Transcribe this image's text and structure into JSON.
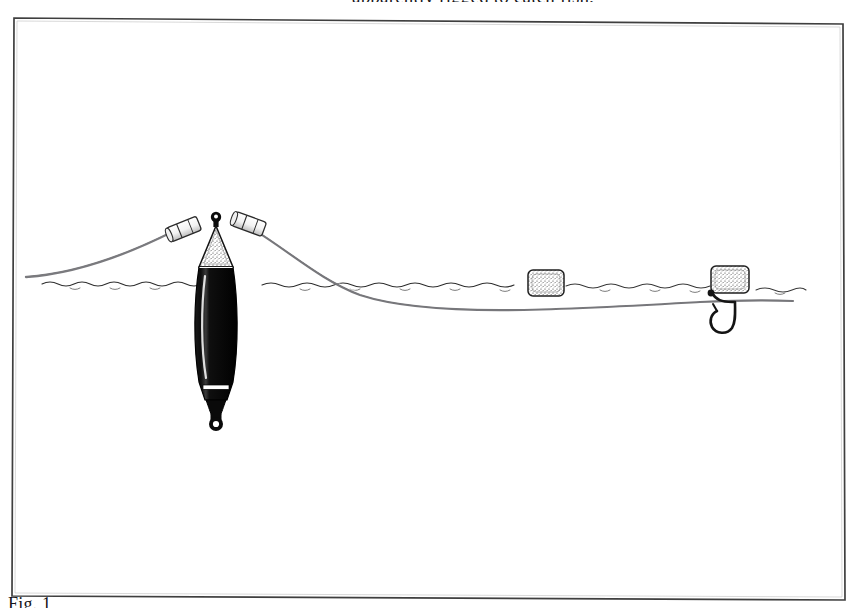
{
  "page": {
    "media": "scanned-book-page",
    "background_color": "#ffffff",
    "ink_color": "#17161a"
  },
  "body_text": {
    "partial_line_above_figure": "apparently rigged to catch fish,",
    "note": "line is cropped by the top edge of the screenshot"
  },
  "caption": {
    "text": "Fig. 1",
    "note": "caption is cropped by the bottom edge of the screenshot"
  },
  "figure": {
    "title": "Fishing float rig with baited hook",
    "frame": {
      "stroke_color": "#3a3a3a",
      "stroke_width": 1.6,
      "fill": "#ffffff",
      "corners": {
        "top_left": [
          14,
          18
        ],
        "top_right": [
          843,
          24
        ],
        "bottom_right": [
          845,
          600
        ],
        "bottom_left": [
          12,
          596
        ]
      },
      "skew_note": "frame is slightly rotated from the scan"
    },
    "waterline": {
      "label": "water surface",
      "y": 284,
      "x_start": 42,
      "x_end": 800,
      "style": "hand-drawn wavy ripple line",
      "color": "#2b2b2b"
    },
    "fishing_line": {
      "label": "monofilament line",
      "color": "#6f6f72",
      "segments": [
        {
          "name": "rod-side-line",
          "from": [
            26,
            276
          ],
          "to": [
            178,
            228
          ]
        },
        {
          "name": "float-to-hook-line",
          "from": [
            246,
            224
          ],
          "to": [
            793,
            301
          ]
        }
      ]
    },
    "float": {
      "label": "slider float / bobber",
      "body_color": "#111111",
      "tip_color": "#ffffff",
      "tip_style": "stippled conical antenna tip",
      "center_x": 216,
      "top_y": 214,
      "bottom_y": 430,
      "body_width": 40,
      "parts": [
        "top wire ring",
        "stippled white cone tip",
        "black barrel body",
        "white band near base",
        "tapered stem",
        "bottom eyelet ring"
      ]
    },
    "stop_beads": [
      {
        "name": "left-stop-bead",
        "x": 184,
        "y": 229,
        "angle": -22
      },
      {
        "name": "right-stop-bead",
        "x": 249,
        "y": 224,
        "angle": 20
      }
    ],
    "baits": [
      {
        "name": "floating-bait-middle",
        "label": "bread / bait cube",
        "x": 546,
        "y": 283,
        "width": 36,
        "height": 26,
        "texture": "stippled"
      },
      {
        "name": "hook-bait-right",
        "label": "baited bread on hook",
        "x": 729,
        "y": 281,
        "width": 38,
        "height": 27,
        "texture": "stippled"
      }
    ],
    "hook": {
      "label": "fish hook",
      "color": "#1a1a1a",
      "shank_x": 733,
      "bend_bottom_y": 330,
      "point_direction": "up"
    }
  }
}
